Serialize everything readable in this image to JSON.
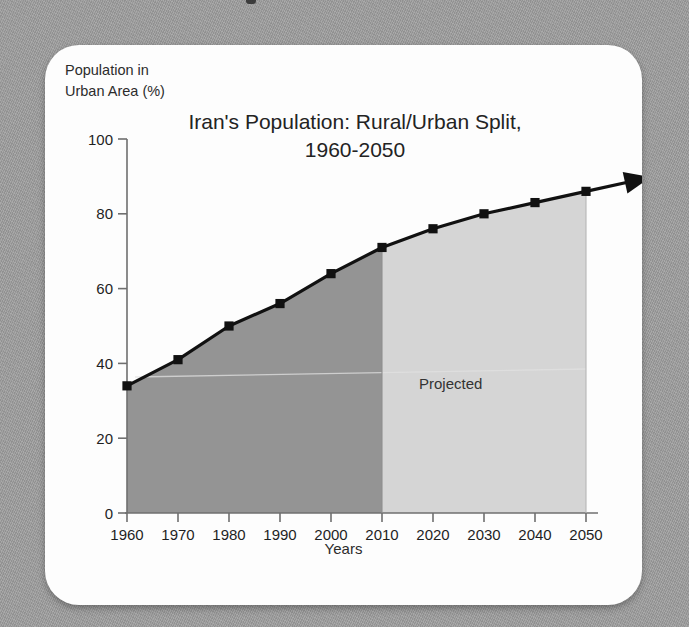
{
  "background": {
    "color": "#9c9c9c",
    "card_color": "#fdfdfd"
  },
  "chart_data": {
    "type": "area",
    "title_line1": "Iran's Population: Rural/Urban Split,",
    "title_line2": "1960-2050",
    "xlabel": "Years",
    "ylabel": "Population in\nUrban Area (%)",
    "ylabel_line1": "Population in",
    "ylabel_line2": "Urban Area (%)",
    "categories": [
      "1960",
      "1970",
      "1980",
      "1990",
      "2000",
      "2010",
      "2020",
      "2030",
      "2040",
      "2050"
    ],
    "x": [
      1960,
      1970,
      1980,
      1990,
      2000,
      2010,
      2020,
      2030,
      2040,
      2050
    ],
    "values": [
      34,
      41,
      50,
      56,
      64,
      71,
      76,
      80,
      83,
      86
    ],
    "series": [
      {
        "name": "Urban population share",
        "values": [
          34,
          41,
          50,
          56,
          64,
          71,
          76,
          80,
          83,
          86
        ]
      }
    ],
    "xlim": [
      1960,
      2050
    ],
    "ylim": [
      0,
      100
    ],
    "ytick_labels": [
      "0",
      "20",
      "40",
      "60",
      "80",
      "100"
    ],
    "yticks": [
      0,
      20,
      40,
      60,
      80,
      100
    ],
    "xtick_labels": [
      "1960",
      "1970",
      "1980",
      "1990",
      "2000",
      "2010",
      "2020",
      "2030",
      "2040",
      "2050"
    ],
    "grid": false,
    "legend": "none",
    "annotations": [
      {
        "text": "Projected",
        "x": 2030,
        "y": 40
      }
    ],
    "regions": [
      {
        "name": "historical",
        "from": 1960,
        "to": 2010,
        "fill": "#949494"
      },
      {
        "name": "projected",
        "from": 2010,
        "to": 2050,
        "fill": "#d5d5d5"
      }
    ],
    "line_color": "#111111",
    "marker": "square",
    "arrow_at_end": true
  }
}
